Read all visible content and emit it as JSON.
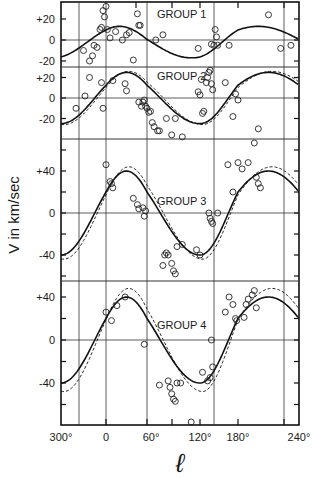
{
  "figure": {
    "ylabel": "V in km/sec",
    "xlabel": "ℓ",
    "x_ticks": [
      "300°",
      "0",
      "60°",
      "120°",
      "180°",
      "240°"
    ]
  },
  "chart_data": [
    {
      "type": "scatter",
      "title": "GROUP 1",
      "xlabel": "ℓ (deg)",
      "ylabel": "V in km/sec",
      "xlim": [
        300,
        240
      ],
      "ylim": [
        -25,
        35
      ],
      "y_ticks": [
        "+20",
        "0",
        "-20"
      ],
      "series": [
        {
          "name": "observed",
          "style": "open-circle",
          "points": [
            [
              330,
              -10
            ],
            [
              338,
              -20
            ],
            [
              342,
              -15
            ],
            [
              344,
              -5
            ],
            [
              348,
              -7
            ],
            [
              352,
              10
            ],
            [
              354,
              12
            ],
            [
              356,
              28
            ],
            [
              358,
              22
            ],
            [
              0,
              32
            ],
            [
              2,
              10
            ],
            [
              6,
              2
            ],
            [
              14,
              8
            ],
            [
              24,
              0
            ],
            [
              30,
              5
            ],
            [
              34,
              7
            ],
            [
              40,
              -19
            ],
            [
              46,
              25
            ],
            [
              48,
              14
            ],
            [
              50,
              14
            ],
            [
              70,
              0
            ],
            [
              78,
              5
            ],
            [
              118,
              -8
            ],
            [
              138,
              -4
            ],
            [
              142,
              -5
            ],
            [
              144,
              10
            ],
            [
              146,
              3
            ],
            [
              148,
              -5
            ],
            [
              166,
              -5
            ],
            [
              210,
              24
            ],
            [
              222,
              -8
            ],
            [
              232,
              -5
            ]
          ]
        },
        {
          "name": "model",
          "style": "solid-line",
          "amplitude": 15,
          "offset": -2
        }
      ]
    },
    {
      "type": "scatter",
      "title": "GROUP 2",
      "ylim": [
        -30,
        30
      ],
      "y_ticks": [
        "+20",
        "0",
        "-20"
      ],
      "series": [
        {
          "name": "observed",
          "style": "open-circle",
          "points": [
            [
              320,
              -10
            ],
            [
              332,
              2
            ],
            [
              338,
              20
            ],
            [
              354,
              15
            ],
            [
              356,
              -10
            ],
            [
              10,
              17
            ],
            [
              28,
              14
            ],
            [
              30,
              7
            ],
            [
              48,
              -4
            ],
            [
              52,
              -8
            ],
            [
              54,
              -4
            ],
            [
              56,
              -2
            ],
            [
              58,
              -8
            ],
            [
              60,
              -10
            ],
            [
              62,
              -14
            ],
            [
              64,
              -13
            ],
            [
              66,
              -24
            ],
            [
              68,
              -28
            ],
            [
              72,
              -32
            ],
            [
              74,
              -32
            ],
            [
              82,
              -20
            ],
            [
              88,
              -36
            ],
            [
              92,
              -20
            ],
            [
              100,
              -38
            ],
            [
              118,
              6
            ],
            [
              120,
              3
            ],
            [
              122,
              18
            ],
            [
              124,
              -15
            ],
            [
              126,
              -13
            ],
            [
              130,
              15
            ],
            [
              132,
              20
            ],
            [
              134,
              25
            ],
            [
              136,
              27
            ],
            [
              138,
              14
            ],
            [
              140,
              8
            ],
            [
              160,
              15
            ],
            [
              172,
              -18
            ],
            [
              176,
              4
            ],
            [
              180,
              -2
            ],
            [
              200,
              -30
            ]
          ]
        },
        {
          "name": "model-solid",
          "style": "solid-line",
          "amplitude": 25
        },
        {
          "name": "model-dashed",
          "style": "dashed-line",
          "amplitude": 26
        }
      ]
    },
    {
      "type": "scatter",
      "title": "GROUP 3",
      "ylim": [
        -65,
        70
      ],
      "y_ticks": [
        "+40",
        "0",
        "-40"
      ],
      "series": [
        {
          "name": "observed",
          "style": "open-circle",
          "points": [
            [
              0,
              46
            ],
            [
              6,
              30
            ],
            [
              8,
              28
            ],
            [
              10,
              24
            ],
            [
              40,
              14
            ],
            [
              46,
              8
            ],
            [
              48,
              4
            ],
            [
              54,
              5
            ],
            [
              56,
              -3
            ],
            [
              58,
              2
            ],
            [
              78,
              -50
            ],
            [
              80,
              -40
            ],
            [
              82,
              -38
            ],
            [
              84,
              -40
            ],
            [
              88,
              -48
            ],
            [
              90,
              -55
            ],
            [
              92,
              -58
            ],
            [
              94,
              -32
            ],
            [
              100,
              -30
            ],
            [
              116,
              -35
            ],
            [
              120,
              -40
            ],
            [
              134,
              0
            ],
            [
              136,
              -5
            ],
            [
              138,
              -8
            ],
            [
              140,
              -10
            ],
            [
              148,
              0
            ],
            [
              164,
              46
            ],
            [
              172,
              20
            ],
            [
              180,
              48
            ],
            [
              184,
              42
            ],
            [
              190,
              48
            ],
            [
              196,
              70
            ],
            [
              198,
              34
            ],
            [
              200,
              28
            ],
            [
              202,
              24
            ]
          ]
        },
        {
          "name": "model-solid",
          "style": "solid-line",
          "amplitude": 40
        },
        {
          "name": "model-dashed",
          "style": "dashed-line",
          "amplitude": 44
        }
      ]
    },
    {
      "type": "scatter",
      "title": "GROUP 4",
      "ylim": [
        -80,
        60
      ],
      "y_ticks": [
        "+40",
        "0",
        "-40"
      ],
      "series": [
        {
          "name": "observed",
          "style": "open-circle",
          "points": [
            [
              0,
              26
            ],
            [
              8,
              18
            ],
            [
              16,
              32
            ],
            [
              28,
              40
            ],
            [
              56,
              -4
            ],
            [
              74,
              -42
            ],
            [
              84,
              -38
            ],
            [
              86,
              -44
            ],
            [
              88,
              -50
            ],
            [
              90,
              -55
            ],
            [
              92,
              -57
            ],
            [
              94,
              -40
            ],
            [
              98,
              -40
            ],
            [
              110,
              -78
            ],
            [
              124,
              -30
            ],
            [
              132,
              -38
            ],
            [
              136,
              -35
            ],
            [
              138,
              0
            ],
            [
              140,
              -25
            ],
            [
              160,
              26
            ],
            [
              166,
              40
            ],
            [
              172,
              33
            ],
            [
              176,
              20
            ],
            [
              178,
              18
            ],
            [
              186,
              21
            ],
            [
              188,
              33
            ],
            [
              190,
              38
            ],
            [
              194,
              42
            ],
            [
              196,
              46
            ],
            [
              198,
              30
            ]
          ]
        },
        {
          "name": "model-solid",
          "style": "solid-line",
          "amplitude": 40
        },
        {
          "name": "model-dashed",
          "style": "dashed-line",
          "amplitude": 48
        }
      ]
    }
  ]
}
